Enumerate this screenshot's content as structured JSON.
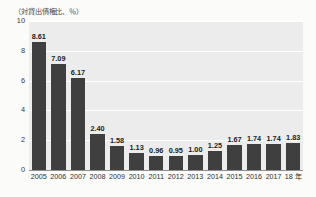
{
  "chart_data": {
    "type": "bar",
    "title": "",
    "subtitle": "",
    "unit_caption": "（対貸出債権比、％）",
    "xlabel": "",
    "ylabel": "",
    "ylim": [
      0,
      10
    ],
    "yticks": [
      0,
      2,
      4,
      6,
      8,
      10
    ],
    "ytick_labels": [
      "0",
      "2",
      "4",
      "6",
      "8",
      "10"
    ],
    "grid": true,
    "grid_color": "#ffffff",
    "legend": "none",
    "bar_color": "#3f3f3f",
    "plot_background": "#ececec",
    "page_background": "#fbfbfa",
    "label_color": "#1c1c1c",
    "categories": [
      "2005",
      "2006",
      "2007",
      "2008",
      "2009",
      "2010",
      "2011",
      "2012",
      "2013",
      "2014",
      "2015",
      "2016",
      "2017",
      "18 年"
    ],
    "values": [
      8.61,
      7.09,
      6.17,
      2.4,
      1.58,
      1.13,
      0.96,
      0.95,
      1.0,
      1.25,
      1.67,
      1.74,
      1.74,
      1.83
    ],
    "value_labels": [
      "8.61",
      "7.09",
      "6.17",
      "2.40",
      "1.58",
      "1.13",
      "0.96",
      "0.95",
      "1.00",
      "1.25",
      "1.67",
      "1.74",
      "1.74",
      "1.83"
    ]
  }
}
